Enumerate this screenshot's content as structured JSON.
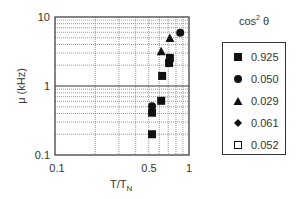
{
  "chart_data": {
    "type": "scatter",
    "title": "",
    "xlabel": "T/T_N",
    "xlabel_main": "T/T",
    "xlabel_sub": "N",
    "ylabel": "μ (kHz)",
    "xscale": "log",
    "yscale": "log",
    "xlim": [
      0.1,
      1
    ],
    "ylim": [
      0.1,
      10
    ],
    "x_ticks": [
      0.1,
      0.5,
      1
    ],
    "x_tick_labels": [
      "0.1",
      "0.5",
      "1"
    ],
    "y_ticks": [
      0.1,
      1,
      10
    ],
    "y_tick_labels": [
      "0.1",
      "1",
      "10"
    ],
    "grid": true,
    "legend_position": "right",
    "legend_title": "cos² θ",
    "legend_title_main": "cos",
    "legend_title_sup": "2",
    "legend_title_tail": "θ",
    "series": [
      {
        "name": "0.925",
        "marker": "square-filled",
        "points": [
          [
            0.53,
            0.2
          ],
          [
            0.53,
            0.41
          ],
          [
            0.62,
            0.61
          ],
          [
            0.63,
            1.4
          ],
          [
            0.71,
            2.15
          ],
          [
            0.72,
            2.55
          ]
        ]
      },
      {
        "name": "0.050",
        "marker": "circle-filled",
        "points": [
          [
            0.53,
            0.51
          ],
          [
            0.86,
            5.9
          ]
        ]
      },
      {
        "name": "0.029",
        "marker": "triangle-filled",
        "points": [
          [
            0.62,
            3.2
          ],
          [
            0.72,
            4.96
          ]
        ]
      },
      {
        "name": "0.061",
        "marker": "diamond-filled",
        "points": [
          [
            0.71,
            2.2
          ]
        ]
      },
      {
        "name": "0.052",
        "marker": "square-open",
        "points": []
      }
    ]
  },
  "legend": {
    "items": [
      {
        "label": "0.925",
        "marker": "square-filled"
      },
      {
        "label": "0.050",
        "marker": "circle-filled"
      },
      {
        "label": "0.029",
        "marker": "triangle-filled"
      },
      {
        "label": "0.061",
        "marker": "diamond-filled"
      },
      {
        "label": "0.052",
        "marker": "square-open"
      }
    ]
  },
  "colors": {
    "marker": "#111111",
    "axis": "#333333",
    "grid": "#555555"
  }
}
